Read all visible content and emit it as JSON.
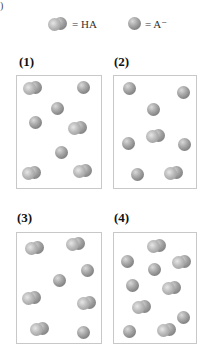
{
  "header_fragment": ")",
  "legend": {
    "ha_label": "= HA",
    "a_minus_label": "= A⁻"
  },
  "colors": {
    "particle": "#8a8a8a",
    "box_border": "#c8c8c8",
    "background": "#ffffff"
  },
  "panels": [
    {
      "label": "(1)",
      "box": {
        "x": 16,
        "y": 75,
        "w": 86,
        "h": 114
      },
      "particles": [
        {
          "type": "HA",
          "x": 33,
          "y": 88
        },
        {
          "type": "A-",
          "x": 83,
          "y": 87
        },
        {
          "type": "A-",
          "x": 57,
          "y": 108
        },
        {
          "type": "A-",
          "x": 35,
          "y": 122
        },
        {
          "type": "HA",
          "x": 78,
          "y": 128
        },
        {
          "type": "A-",
          "x": 61,
          "y": 152
        },
        {
          "type": "HA",
          "x": 32,
          "y": 173
        },
        {
          "type": "HA",
          "x": 83,
          "y": 171
        }
      ]
    },
    {
      "label": "(2)",
      "box": {
        "x": 113,
        "y": 75,
        "w": 84,
        "h": 114
      },
      "particles": [
        {
          "type": "A-",
          "x": 129,
          "y": 88
        },
        {
          "type": "A-",
          "x": 183,
          "y": 92
        },
        {
          "type": "A-",
          "x": 153,
          "y": 109
        },
        {
          "type": "HA",
          "x": 156,
          "y": 136
        },
        {
          "type": "A-",
          "x": 128,
          "y": 143
        },
        {
          "type": "A-",
          "x": 184,
          "y": 144
        },
        {
          "type": "A-",
          "x": 137,
          "y": 174
        },
        {
          "type": "HA",
          "x": 174,
          "y": 173
        }
      ]
    },
    {
      "label": "(3)",
      "box": {
        "x": 16,
        "y": 232,
        "w": 86,
        "h": 112
      },
      "particles": [
        {
          "type": "HA",
          "x": 35,
          "y": 248
        },
        {
          "type": "HA",
          "x": 76,
          "y": 244
        },
        {
          "type": "A-",
          "x": 87,
          "y": 270
        },
        {
          "type": "A-",
          "x": 59,
          "y": 280
        },
        {
          "type": "HA",
          "x": 32,
          "y": 298
        },
        {
          "type": "HA",
          "x": 87,
          "y": 303
        },
        {
          "type": "HA",
          "x": 40,
          "y": 329
        },
        {
          "type": "A-",
          "x": 83,
          "y": 332
        }
      ]
    },
    {
      "label": "(4)",
      "box": {
        "x": 113,
        "y": 232,
        "w": 84,
        "h": 112
      },
      "particles": [
        {
          "type": "HA",
          "x": 157,
          "y": 246
        },
        {
          "type": "A-",
          "x": 127,
          "y": 261
        },
        {
          "type": "HA",
          "x": 182,
          "y": 262
        },
        {
          "type": "A-",
          "x": 154,
          "y": 269
        },
        {
          "type": "A-",
          "x": 132,
          "y": 285
        },
        {
          "type": "HA",
          "x": 172,
          "y": 288
        },
        {
          "type": "HA",
          "x": 142,
          "y": 307
        },
        {
          "type": "A-",
          "x": 183,
          "y": 317
        },
        {
          "type": "A-",
          "x": 129,
          "y": 331
        },
        {
          "type": "HA",
          "x": 167,
          "y": 330
        }
      ]
    }
  ]
}
